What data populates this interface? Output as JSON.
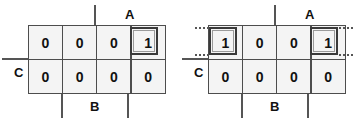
{
  "diagram": {
    "type": "karnaugh-map",
    "colors": {
      "cell_fill": "#f4f4f4",
      "grid_line": "#4d4d4d",
      "marker_line": "#555555",
      "group_border": "#3a3a3a",
      "text": "#111111",
      "background": "#ffffff"
    },
    "maps": [
      {
        "id": "left",
        "variables": [
          "A",
          "B",
          "C"
        ],
        "rows": 2,
        "columns": 4,
        "cells": [
          [
            "0",
            "0",
            "0",
            "1"
          ],
          [
            "0",
            "0",
            "0",
            "0"
          ]
        ],
        "labels": {
          "a": "A",
          "b": "B",
          "c": "C"
        },
        "groups": [
          {
            "name": "single-cell-group",
            "row": 0,
            "col": 3,
            "width": 1,
            "height": 1,
            "wrap": false
          }
        ],
        "wrap_markers": []
      },
      {
        "id": "right",
        "variables": [
          "A",
          "B",
          "C"
        ],
        "rows": 2,
        "columns": 4,
        "cells": [
          [
            "1",
            "0",
            "0",
            "1"
          ],
          [
            "0",
            "0",
            "0",
            "0"
          ]
        ],
        "labels": {
          "a": "A",
          "b": "B",
          "c": "C"
        },
        "groups": [
          {
            "name": "wrap-group-left",
            "row": 0,
            "col": 0,
            "width": 1,
            "height": 1,
            "wrap": true
          },
          {
            "name": "wrap-group-right",
            "row": 0,
            "col": 3,
            "width": 1,
            "height": 1,
            "wrap": true
          }
        ],
        "wrap_markers": [
          "left-top",
          "left-bottom",
          "right-top",
          "right-bottom"
        ]
      }
    ]
  }
}
